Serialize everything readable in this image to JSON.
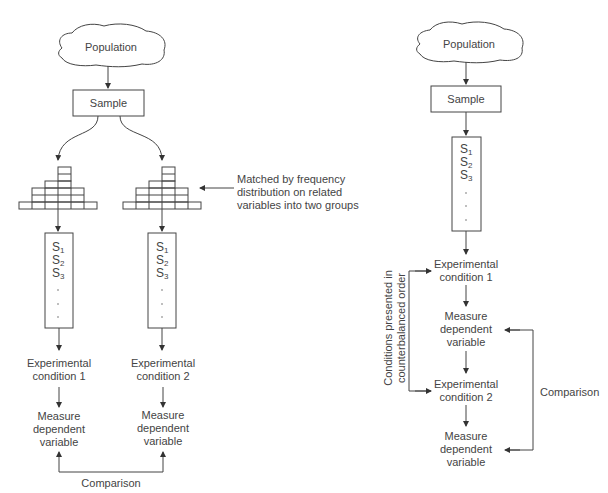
{
  "left_diagram": {
    "title": "Matched groups design",
    "population": "Population",
    "sample": "Sample",
    "histogram_annotation": [
      "Matched by frequency",
      "distribution on related",
      "variables into two groups"
    ],
    "groups": [
      {
        "subjects": [
          "S",
          "S",
          "S"
        ],
        "subscripts": [
          "1",
          "2",
          "3"
        ],
        "condition": [
          "Experimental",
          "condition 1"
        ],
        "measure": [
          "Measure",
          "dependent",
          "variable"
        ]
      },
      {
        "subjects": [
          "S",
          "S",
          "S"
        ],
        "subscripts": [
          "1",
          "2",
          "3"
        ],
        "condition": [
          "Experimental",
          "condition 2"
        ],
        "measure": [
          "Measure",
          "dependent",
          "variable"
        ]
      }
    ],
    "comparison": "Comparison"
  },
  "right_diagram": {
    "title": "Repeated measures design",
    "population": "Population",
    "sample": "Sample",
    "subjects": [
      "S",
      "S",
      "S"
    ],
    "subscripts": [
      "1",
      "2",
      "3"
    ],
    "condition_1": [
      "Experimental",
      "condition 1"
    ],
    "measure_1": [
      "Measure",
      "dependent",
      "variable"
    ],
    "condition_2": [
      "Experimental",
      "condition 2"
    ],
    "measure_2": [
      "Measure",
      "dependent",
      "variable"
    ],
    "counterbalance_label": [
      "Conditions presented in",
      "counterbalanced order"
    ],
    "comparison": "Comparison"
  },
  "colors": {
    "line": "#444444",
    "text": "#444444",
    "background": "#ffffff"
  }
}
